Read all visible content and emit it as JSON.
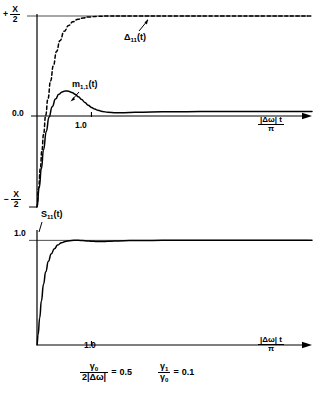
{
  "figure": {
    "background": "#ffffff",
    "ink": "#000000"
  },
  "chart_data": {
    "type": "line",
    "title": "",
    "panels": [
      {
        "name": "upper-panel",
        "xlabel_parts": {
          "num": "|Δω| t",
          "den": "π"
        },
        "ylabel": "",
        "xlim": [
          0,
          5.05
        ],
        "ylim": [
          -1.0,
          1.0
        ],
        "xticks": [
          1.0
        ],
        "xticklabels": [
          "1.0"
        ],
        "yticks": [
          1.0,
          0.0,
          -1.0
        ],
        "yticklabels": [
          "+ X/2",
          "0.0",
          "- X/2"
        ],
        "grid": false,
        "series": [
          {
            "name": "Δ₁₁(t)",
            "label_display": "Δ",
            "label_sub": "11",
            "label_tail": "(t)",
            "style": "dashed",
            "x": [
              0.0,
              0.03,
              0.06,
              0.09,
              0.12,
              0.16,
              0.2,
              0.25,
              0.3,
              0.36,
              0.42,
              0.5,
              0.58,
              0.66,
              0.75,
              0.85,
              0.95,
              1.1,
              1.3,
              1.6,
              2.0,
              2.6,
              3.4,
              4.2,
              5.05
            ],
            "y": [
              -1.0,
              -0.8,
              -0.6,
              -0.41,
              -0.24,
              -0.04,
              0.13,
              0.32,
              0.48,
              0.63,
              0.74,
              0.84,
              0.9,
              0.94,
              0.965,
              0.98,
              0.99,
              0.996,
              1.0,
              1.0,
              1.0,
              1.0,
              1.0,
              1.0,
              1.0
            ]
          },
          {
            "name": "m₁,₁(t)",
            "label_display": "m",
            "label_sub": "1,1",
            "label_tail": "(t)",
            "style": "solid",
            "x": [
              0.0,
              0.04,
              0.08,
              0.12,
              0.17,
              0.22,
              0.28,
              0.34,
              0.4,
              0.46,
              0.52,
              0.58,
              0.64,
              0.7,
              0.76,
              0.82,
              0.88,
              0.94,
              1.0,
              1.06,
              1.12,
              1.2,
              1.3,
              1.45,
              1.6,
              1.8,
              2.1,
              2.5,
              3.0,
              3.6,
              4.3,
              5.05
            ],
            "y": [
              -1.0,
              -0.8,
              -0.6,
              -0.4,
              -0.21,
              -0.06,
              0.05,
              0.13,
              0.18,
              0.205,
              0.215,
              0.212,
              0.2,
              0.18,
              0.155,
              0.125,
              0.095,
              0.066,
              0.043,
              0.025,
              0.012,
              0.0,
              -0.008,
              -0.012,
              -0.012,
              -0.009,
              -0.005,
              -0.002,
              -0.001,
              0.0,
              0.0,
              0.0
            ]
          }
        ]
      },
      {
        "name": "lower-panel",
        "xlabel_parts": {
          "num": "|Δω| t",
          "den": "π"
        },
        "ylabel": "",
        "xlim": [
          0,
          5.05
        ],
        "ylim": [
          0.0,
          1.08
        ],
        "xticks": [
          1.0
        ],
        "xticklabels": [
          "1.0"
        ],
        "yticks": [
          1.0
        ],
        "yticklabels": [
          "1.0"
        ],
        "grid": false,
        "series": [
          {
            "name": "S₁₁(t)",
            "label_display": "S",
            "label_sub": "11",
            "label_tail": "(t)",
            "style": "solid",
            "x": [
              0.0,
              0.02,
              0.05,
              0.08,
              0.12,
              0.16,
              0.21,
              0.26,
              0.32,
              0.38,
              0.45,
              0.52,
              0.6,
              0.68,
              0.76,
              0.84,
              0.92,
              1.0,
              1.08,
              1.16,
              1.25,
              1.35,
              1.5,
              1.7,
              1.95,
              2.3,
              2.8,
              3.4,
              4.1,
              4.6,
              5.05
            ],
            "y": [
              0.0,
              0.1,
              0.26,
              0.42,
              0.58,
              0.7,
              0.8,
              0.87,
              0.92,
              0.955,
              0.978,
              0.99,
              0.997,
              1.0,
              1.0,
              0.998,
              0.995,
              0.992,
              0.99,
              0.989,
              0.99,
              0.992,
              0.995,
              0.998,
              0.999,
              1.0,
              1.0,
              1.0,
              1.0,
              1.0,
              1.0
            ]
          }
        ]
      }
    ]
  },
  "annotations": {
    "delta_label": {
      "base": "Δ",
      "sub": "11",
      "tail": "(t)"
    },
    "m_label": {
      "base": "m",
      "sub": "1,1",
      "tail": "(t)"
    },
    "s_label": {
      "base": "S",
      "sub": "11",
      "tail": "(t)"
    },
    "y_top_sign": "+",
    "y_top_num": "X",
    "y_top_den": "2",
    "y_zero": "0.0",
    "y_bottom_sign": "−",
    "y_bottom_num": "X",
    "y_bottom_den": "2",
    "y_lower_one": "1.0",
    "x_tick_upper": "1.0",
    "x_tick_lower": "1.0",
    "xaxis_num": "|Δω| t",
    "xaxis_den": "π"
  },
  "caption": {
    "eq1": {
      "num_base": "γ",
      "num_sub": "0",
      "den": "2|Δω|",
      "equals": "=",
      "value": "0.5"
    },
    "eq2": {
      "num_base": "γ",
      "num_sub": "1",
      "den_base": "γ",
      "den_sub": "0",
      "equals": "=",
      "value": "0.1"
    }
  }
}
